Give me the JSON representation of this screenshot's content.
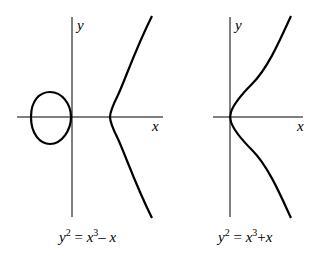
{
  "panels": [
    {
      "x_label": "x",
      "y_label": "y",
      "caption": {
        "lhs": "y",
        "lhs_exp": "2",
        "eq": " = ",
        "a": "x",
        "a_exp": "3",
        "op": "– ",
        "b": "x"
      },
      "equation": "y^2 = x^3 - x"
    },
    {
      "x_label": "x",
      "y_label": "y",
      "caption": {
        "lhs": "y",
        "lhs_exp": "2",
        "eq": " = ",
        "a": "x",
        "a_exp": "3",
        "op": "+",
        "b": "x"
      },
      "equation": "y^2 = x^3 + x"
    }
  ],
  "colors": {
    "stroke": "#000000",
    "background": "#ffffff"
  }
}
